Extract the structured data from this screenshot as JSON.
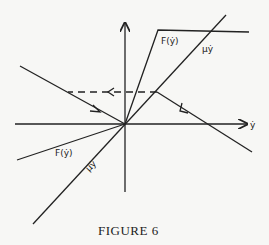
{
  "figure": {
    "caption": "Figure 6",
    "caption_display": "FIGURE 6",
    "labels": {
      "f_upper": "F(ẏ)",
      "mu_upper": "μẏ",
      "f_lower": "F(ẏ)",
      "mu_lower": "μẏ",
      "x_axis": "ẏ"
    },
    "colors": {
      "ink": "#222222",
      "paper": "#f7f7f5"
    },
    "geometry": {
      "origin": [
        125,
        124
      ],
      "vertical_axis": {
        "top": [
          125,
          22
        ],
        "bottom": [
          125,
          192
        ]
      },
      "horizontal_axis": {
        "left": [
          15,
          124
        ],
        "right": [
          248,
          124
        ]
      },
      "F_upper": [
        [
          125,
          124
        ],
        [
          158,
          30
        ],
        [
          249,
          32
        ]
      ],
      "F_lower": [
        [
          125,
          124
        ],
        [
          17,
          160
        ]
      ],
      "mu_line": [
        [
          33,
          224
        ],
        [
          226,
          15
        ]
      ],
      "trajectory_left": [
        [
          20,
          66
        ],
        [
          125,
          124
        ]
      ],
      "trajectory_dashed": [
        [
          157,
          92
        ],
        [
          68,
          92
        ]
      ],
      "trajectory_right": [
        [
          252,
          152
        ],
        [
          157,
          92
        ]
      ]
    }
  }
}
